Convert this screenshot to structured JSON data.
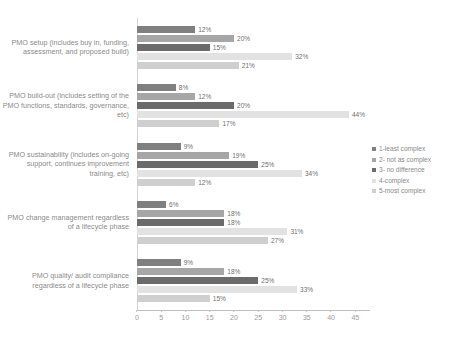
{
  "chart_data": {
    "type": "bar",
    "orientation": "horizontal",
    "title": "",
    "xlabel": "",
    "ylabel": "",
    "xlim": [
      0,
      47
    ],
    "xticks": [
      0,
      5,
      10,
      15,
      20,
      25,
      30,
      35,
      40,
      45
    ],
    "grid": false,
    "legend_position": "right",
    "value_suffix": "%",
    "categories": [
      "PMO setup (includes buy in, funding, assessment, and proposed build)",
      "PMO build-out (includes setting of the PMO functions, standards, governance, etc)",
      "PMO sustainability (includes on-going support, continues improvement training, etc)",
      "PMO change management regardless of a lifecycle phase",
      "PMO quality/ audit compliance regardless of a lifecycle phase"
    ],
    "series": [
      {
        "name": "1-least complex",
        "color": "#7f7f7f",
        "values": [
          12,
          8,
          9,
          6,
          9
        ],
        "labels": [
          "12%",
          "8%",
          "9%",
          "6%",
          "9%"
        ]
      },
      {
        "name": "2- not as complex",
        "color": "#a6a6a6",
        "values": [
          20,
          12,
          19,
          18,
          18
        ],
        "labels": [
          "20%",
          "12%",
          "19%",
          "18%",
          "18%"
        ]
      },
      {
        "name": "3- no difference",
        "color": "#6b6b6b",
        "values": [
          15,
          20,
          25,
          18,
          25
        ],
        "labels": [
          "15%",
          "20%",
          "25%",
          "18%",
          "25%"
        ]
      },
      {
        "name": "4-complex",
        "color": "#e2e2e2",
        "values": [
          32,
          44,
          34,
          31,
          33
        ],
        "labels": [
          "32%",
          "44%",
          "34%",
          "31%",
          "33%"
        ]
      },
      {
        "name": "5-most complex",
        "color": "#cfcfcf",
        "values": [
          21,
          17,
          12,
          27,
          15
        ],
        "labels": [
          "21%",
          "17%",
          "12%",
          "27%",
          "15%"
        ]
      }
    ]
  }
}
